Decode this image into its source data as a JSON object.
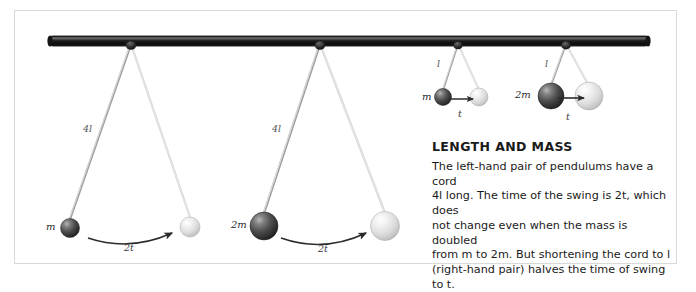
{
  "figure": {
    "background_color": "#ffffff",
    "panel_border_color": "#d9d9d9",
    "bar_color": "#1c1c1c"
  },
  "caption": {
    "heading": "LENGTH AND MASS",
    "line1": "The left-hand pair of pendulums have a cord",
    "line2": "4l long. The time of the swing is 2t, which does",
    "line3": "not change even when the mass is doubled",
    "line4": "from m to 2m. But shortening the cord to l",
    "line5": "(right-hand pair) halves the time of swing to t.",
    "body": "The left-hand pair of pendulums have a cord 4l long. The time of the swing is 2t, which does not change even when the mass is doubled from m to 2m. But shortening the cord to l (right-hand pair) halves the time of swing to t."
  },
  "pendulums": [
    {
      "id": "pendulum-1",
      "cord_label": "4l",
      "mass_label": "m",
      "time_label": "2t",
      "pivot": {
        "x": 131,
        "y": 44
      },
      "start_bob": {
        "x": 70,
        "y": 228,
        "r": 9.5,
        "color": "#4a4a4a"
      },
      "end_bob": {
        "x": 190,
        "y": 227,
        "r": 10,
        "color": "#dcdcdc"
      },
      "cord_label_pos": {
        "x": 83,
        "y": 128
      },
      "time_label_pos": {
        "x": 124,
        "y": 245
      }
    },
    {
      "id": "pendulum-2",
      "cord_label": "4l",
      "mass_label": "2m",
      "time_label": "2t",
      "pivot": {
        "x": 320,
        "y": 44
      },
      "start_bob": {
        "x": 264,
        "y": 226,
        "r": 14,
        "color": "#4a4a4a"
      },
      "end_bob": {
        "x": 385,
        "y": 226,
        "r": 14.5,
        "color": "#dcdcdc"
      },
      "cord_label_pos": {
        "x": 272,
        "y": 128
      },
      "time_label_pos": {
        "x": 319,
        "y": 246
      }
    },
    {
      "id": "pendulum-3",
      "cord_label": "l",
      "mass_label": "m",
      "time_label": "t",
      "pivot": {
        "x": 458,
        "y": 44
      },
      "start_bob": {
        "x": 443,
        "y": 97,
        "r": 8.5,
        "color": "#4a4a4a"
      },
      "end_bob": {
        "x": 479,
        "y": 97,
        "r": 9,
        "color": "#dcdcdc"
      },
      "cord_label_pos": {
        "x": 438,
        "y": 64
      },
      "time_label_pos": {
        "x": 458,
        "y": 114
      }
    },
    {
      "id": "pendulum-4",
      "cord_label": "l",
      "mass_label": "2m",
      "time_label": "t",
      "pivot": {
        "x": 566,
        "y": 44
      },
      "start_bob": {
        "x": 551,
        "y": 96,
        "r": 13,
        "color": "#4a4a4a"
      },
      "end_bob": {
        "x": 589,
        "y": 96,
        "r": 14,
        "color": "#dcdcdc"
      },
      "cord_label_pos": {
        "x": 545,
        "y": 64
      },
      "time_label_pos": {
        "x": 567,
        "y": 117
      }
    }
  ],
  "support_bar": {
    "x1": 48,
    "y1": 36,
    "x2": 650,
    "y2": 46
  }
}
